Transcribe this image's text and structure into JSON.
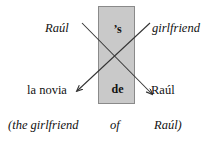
{
  "diagram": {
    "type": "crossed-association-diagram",
    "colors": {
      "box_fill": "#c9c9c9",
      "box_border": "#8a8a8a",
      "text": "#111111",
      "line": "#333333",
      "background": "#ffffff"
    },
    "markers": {
      "top_label": "’s",
      "bottom_label": "de"
    },
    "source_row": {
      "left_label": "Raúl",
      "right_label": "girlfriend"
    },
    "target_row": {
      "left_label": "la novia",
      "right_label": "Raúl"
    },
    "gloss": {
      "open": "(the girlfriend",
      "middle": "of",
      "close": "Raúl)"
    },
    "arrows": [
      {
        "name": "raul-to-raul",
        "from": "Raúl",
        "to": "Raúl",
        "x1": 82,
        "y1": 23,
        "x2": 152,
        "y2": 94
      },
      {
        "name": "girlfriend-to-la-novia",
        "from": "girlfriend",
        "to": "la novia",
        "x1": 150,
        "y1": 23,
        "x2": 77,
        "y2": 91
      }
    ]
  }
}
